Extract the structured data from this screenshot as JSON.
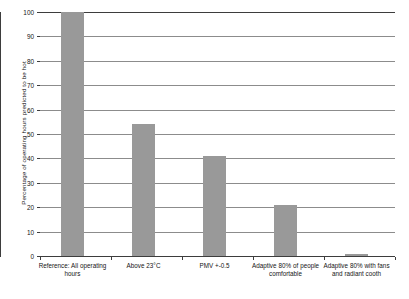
{
  "chart_data": {
    "type": "bar",
    "title": "",
    "xlabel": "",
    "ylabel": "Percentage of operating hours predicted to be hot",
    "ylim": [
      0,
      100
    ],
    "yticks": [
      0,
      10,
      20,
      30,
      40,
      50,
      60,
      70,
      80,
      90,
      100
    ],
    "ytick_labels": [
      "0",
      "10",
      "20",
      "30",
      "40",
      "50",
      "60",
      "70",
      "80",
      "90",
      "100"
    ],
    "grid": true,
    "legend": "none",
    "bar_color": "#999999",
    "axis_color": "#3d3d3d",
    "grid_color": "#8c8c8c",
    "categories": [
      "Reference: All operating hours",
      "Above 23°C",
      "PMV +-0.5",
      "Adaptive 80% of people comfortable",
      "Adaptive 80% with fans and radiant cooth"
    ],
    "values": [
      100,
      54,
      41,
      21,
      1
    ]
  }
}
